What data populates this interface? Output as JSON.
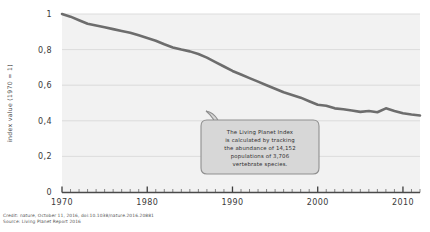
{
  "chart_data": {
    "type": "line",
    "title": "",
    "xlabel": "",
    "ylabel": "index value (1970 = 1)",
    "xlim": [
      1970,
      2012
    ],
    "ylim": [
      0,
      1
    ],
    "grid": true,
    "legend": "none",
    "x_ticks": [
      "1970",
      "1980",
      "1990",
      "2000",
      "2010"
    ],
    "x_tick_values": [
      1970,
      1980,
      1990,
      2000,
      2010
    ],
    "y_ticks": [
      "0",
      "0,2",
      "0,4",
      "0,6",
      "0,8",
      "1"
    ],
    "y_tick_values": [
      0,
      0.2,
      0.4,
      0.6,
      0.8,
      1
    ],
    "minor_tick_interval": 1,
    "series": [
      {
        "name": "Living Planet Index",
        "color": "#6d6d6d",
        "x": [
          1970,
          1971,
          1972,
          1973,
          1974,
          1975,
          1976,
          1977,
          1978,
          1979,
          1980,
          1981,
          1982,
          1983,
          1984,
          1985,
          1986,
          1987,
          1988,
          1989,
          1990,
          1991,
          1992,
          1993,
          1994,
          1995,
          1996,
          1997,
          1998,
          1999,
          2000,
          2001,
          2002,
          2003,
          2004,
          2005,
          2006,
          2007,
          2008,
          2009,
          2010,
          2011,
          2012
        ],
        "values": [
          1.0,
          0.985,
          0.965,
          0.945,
          0.935,
          0.925,
          0.915,
          0.905,
          0.895,
          0.88,
          0.865,
          0.85,
          0.83,
          0.812,
          0.8,
          0.79,
          0.775,
          0.755,
          0.73,
          0.705,
          0.68,
          0.66,
          0.64,
          0.62,
          0.6,
          0.58,
          0.56,
          0.545,
          0.53,
          0.51,
          0.49,
          0.485,
          0.47,
          0.465,
          0.458,
          0.45,
          0.455,
          0.448,
          0.47,
          0.455,
          0.442,
          0.435,
          0.43
        ]
      }
    ]
  },
  "annotation": {
    "lines": [
      "The Living Planet Index",
      "is calculated by tracking",
      "the abundance of 14,152",
      "populations of 3,706",
      "vertebrate species."
    ]
  },
  "credit": {
    "line1": "Credit: nature, October 11, 2016, doi:10.1038/nature.2016.20881",
    "line2": "Source: Living Planet Report 2016"
  },
  "colors": {
    "line": "#6d6d6d",
    "plot_background": "#f2f2f2",
    "gridline": "#d9d9d9",
    "axis": "#4a4a4a",
    "callout_fill": "#d7d7d7"
  }
}
